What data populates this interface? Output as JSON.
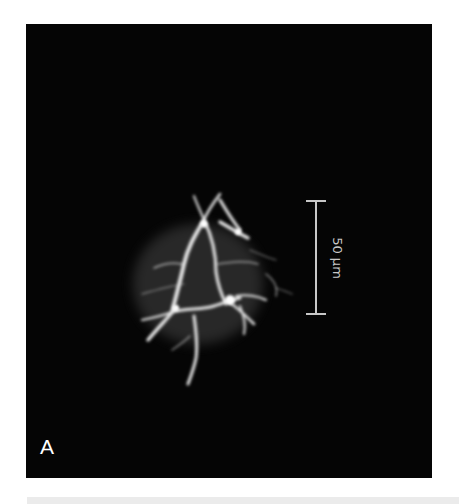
{
  "figure": {
    "panel_label": "A",
    "scale_bar": {
      "label": "50 µm",
      "orientation": "vertical",
      "color": "#c8c8c8"
    },
    "image": {
      "subject": "fluorescent-branched-cell",
      "background_color": "#050505",
      "signal_color": "#f0f0f0"
    }
  }
}
